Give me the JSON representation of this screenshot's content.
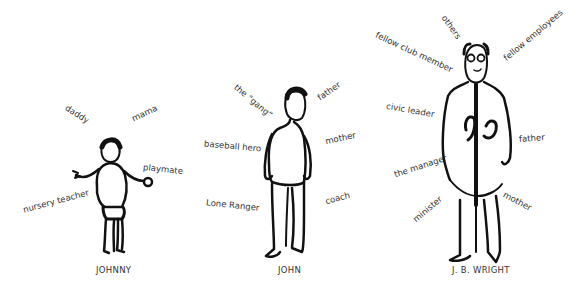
{
  "figures": [
    {
      "caption": "JOHNNY",
      "labels": [
        "daddy",
        "mama",
        "playmate",
        "nursery teacher"
      ]
    },
    {
      "caption": "JOHN",
      "labels": [
        "the “gang”",
        "father",
        "baseball hero",
        "mother",
        "Lone Ranger",
        "coach"
      ]
    },
    {
      "caption": "J. B. WRIGHT",
      "labels": [
        "others",
        "fellow club member",
        "fellow employees",
        "civic leader",
        "father",
        "the manager",
        "minister",
        "mother"
      ]
    }
  ]
}
